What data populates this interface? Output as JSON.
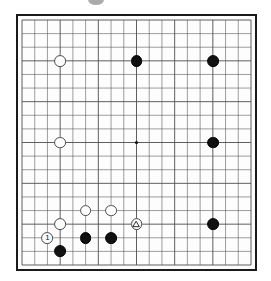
{
  "diagram": {
    "kind": "go-board-diagram",
    "board_size": 19,
    "board_label": "Go board diagram",
    "background_color": "#ffffff",
    "board_color": "#fdfdfd",
    "line_color": "#4d4d4d",
    "border_color": "#1a1a1a",
    "black_color": "#111111",
    "white_color": "#fefefe",
    "white_outline_color": "#4a4a4a",
    "star_points": [
      {
        "col": 4,
        "row": 4
      },
      {
        "col": 10,
        "row": 4
      },
      {
        "col": 16,
        "row": 4
      },
      {
        "col": 4,
        "row": 10
      },
      {
        "col": 10,
        "row": 10
      },
      {
        "col": 16,
        "row": 10
      },
      {
        "col": 4,
        "row": 16
      },
      {
        "col": 10,
        "row": 16
      },
      {
        "col": 16,
        "row": 16
      }
    ],
    "stones": [
      {
        "id": "w-d16",
        "color": "white",
        "col": 4,
        "row": 4,
        "label": "",
        "mark": ""
      },
      {
        "id": "b-k16",
        "color": "black",
        "col": 10,
        "row": 4,
        "label": "",
        "mark": ""
      },
      {
        "id": "b-q16",
        "color": "black",
        "col": 16,
        "row": 4,
        "label": "",
        "mark": ""
      },
      {
        "id": "w-d10",
        "color": "white",
        "col": 4,
        "row": 10,
        "label": "",
        "mark": ""
      },
      {
        "id": "b-q10",
        "color": "black",
        "col": 16,
        "row": 10,
        "label": "",
        "mark": ""
      },
      {
        "id": "b-q4",
        "color": "black",
        "col": 16,
        "row": 16,
        "label": "",
        "mark": ""
      },
      {
        "id": "w-f5",
        "color": "white",
        "col": 6,
        "row": 15,
        "label": "",
        "mark": ""
      },
      {
        "id": "w-h5",
        "color": "white",
        "col": 8,
        "row": 15,
        "label": "",
        "mark": ""
      },
      {
        "id": "w-d4",
        "color": "white",
        "col": 4,
        "row": 16,
        "label": "",
        "mark": ""
      },
      {
        "id": "w-k4",
        "color": "white",
        "col": 10,
        "row": 16,
        "label": "",
        "mark": "triangle"
      },
      {
        "id": "b-f4",
        "color": "black",
        "col": 6,
        "row": 17,
        "label": "",
        "mark": ""
      },
      {
        "id": "b-h4",
        "color": "black",
        "col": 8,
        "row": 17,
        "label": "",
        "mark": ""
      },
      {
        "id": "w-c3",
        "color": "white",
        "col": 3,
        "row": 17,
        "label": "1",
        "mark": ""
      },
      {
        "id": "b-d2",
        "color": "black",
        "col": 4,
        "row": 18,
        "label": "",
        "mark": ""
      }
    ],
    "annotations": {
      "move_number_label": "1",
      "triangle_mark_name": "triangle-marked-stone"
    }
  }
}
